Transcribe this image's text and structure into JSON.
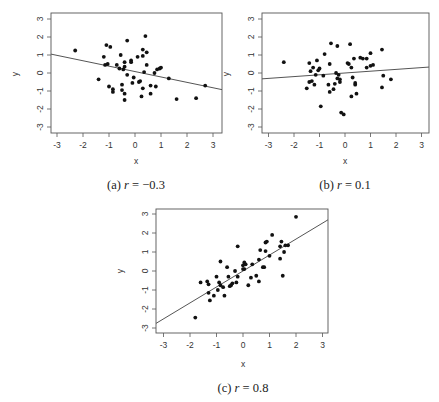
{
  "chart_data": [
    {
      "id": "a",
      "type": "scatter",
      "caption": "(a) r = −0.3",
      "caption_prefix": "(a) ",
      "caption_r": "r",
      "caption_eq": " = −0.3",
      "xlabel": "x",
      "ylabel": "y",
      "xlim": [
        -3.2,
        3.2
      ],
      "ylim": [
        -3.3,
        3.3
      ],
      "xticks": [
        -3,
        -2,
        -1,
        0,
        1,
        2,
        3
      ],
      "yticks": [
        -3,
        -2,
        -1,
        0,
        1,
        2,
        3
      ],
      "grid": false,
      "regression_line": {
        "slope": -0.3,
        "intercept": 0.08
      },
      "box": {
        "left": 51,
        "right": 222,
        "top": 13,
        "bottom": 133
      },
      "map": {
        "x0": 135,
        "sx": 26,
        "y0": 73,
        "sy": 18
      },
      "points": [
        [
          -2.3,
          1.25
        ],
        [
          -1.4,
          -0.35
        ],
        [
          -1.2,
          0.9
        ],
        [
          -1.15,
          0.45
        ],
        [
          -1.1,
          1.55
        ],
        [
          -1.05,
          0.5
        ],
        [
          -1.0,
          -0.75
        ],
        [
          -0.95,
          1.45
        ],
        [
          -0.85,
          -0.9
        ],
        [
          -0.85,
          -1.05
        ],
        [
          -0.7,
          0.45
        ],
        [
          -0.6,
          0.25
        ],
        [
          -0.55,
          1.0
        ],
        [
          -0.5,
          -0.95
        ],
        [
          -0.5,
          -0.65
        ],
        [
          -0.45,
          0.2
        ],
        [
          -0.4,
          0.6
        ],
        [
          -0.4,
          0.35
        ],
        [
          -0.4,
          -1.15
        ],
        [
          -0.4,
          -1.5
        ],
        [
          -0.3,
          1.8
        ],
        [
          -0.3,
          -0.1
        ],
        [
          -0.15,
          0.7
        ],
        [
          -0.15,
          0.6
        ],
        [
          -0.1,
          -0.55
        ],
        [
          -0.05,
          -0.25
        ],
        [
          0.1,
          0.9
        ],
        [
          0.15,
          -0.5
        ],
        [
          0.2,
          -0.45
        ],
        [
          0.25,
          -1.3
        ],
        [
          0.3,
          1.3
        ],
        [
          0.3,
          0.95
        ],
        [
          0.3,
          -0.85
        ],
        [
          0.35,
          0.05
        ],
        [
          0.4,
          2.05
        ],
        [
          0.45,
          1.15
        ],
        [
          0.45,
          0.45
        ],
        [
          0.6,
          -0.7
        ],
        [
          0.6,
          -1.15
        ],
        [
          0.75,
          0.0
        ],
        [
          0.8,
          -0.75
        ],
        [
          0.85,
          0.2
        ],
        [
          0.95,
          0.25
        ],
        [
          1.0,
          0.3
        ],
        [
          1.3,
          -0.3
        ],
        [
          1.6,
          -1.45
        ],
        [
          2.35,
          -1.4
        ],
        [
          2.7,
          -0.7
        ]
      ]
    },
    {
      "id": "b",
      "type": "scatter",
      "caption": "(b) r = 0.1",
      "caption_prefix": "(b) ",
      "caption_r": "r",
      "caption_eq": " = 0.1",
      "xlabel": "x",
      "ylabel": "y",
      "xlim": [
        -3.2,
        3.2
      ],
      "ylim": [
        -3.3,
        3.3
      ],
      "xticks": [
        -3,
        -2,
        -1,
        0,
        1,
        2,
        3
      ],
      "yticks": [
        -3,
        -2,
        -1,
        0,
        1,
        2,
        3
      ],
      "grid": false,
      "regression_line": {
        "slope": 0.1,
        "intercept": 0.0
      },
      "box": {
        "left": 262,
        "right": 429,
        "top": 13,
        "bottom": 133
      },
      "map": {
        "x0": 345,
        "sx": 25.5,
        "y0": 73,
        "sy": 18
      },
      "points": [
        [
          -2.4,
          0.6
        ],
        [
          -1.5,
          -0.85
        ],
        [
          -1.4,
          0.55
        ],
        [
          -1.4,
          -0.5
        ],
        [
          -1.35,
          0.1
        ],
        [
          -1.3,
          -0.45
        ],
        [
          -1.25,
          0.3
        ],
        [
          -1.2,
          -0.65
        ],
        [
          -1.15,
          -0.1
        ],
        [
          -1.1,
          0.7
        ],
        [
          -1.05,
          0.15
        ],
        [
          -1.0,
          0.25
        ],
        [
          -0.95,
          -1.85
        ],
        [
          -0.85,
          -0.15
        ],
        [
          -0.8,
          1.05
        ],
        [
          -0.65,
          -0.65
        ],
        [
          -0.6,
          -1.05
        ],
        [
          -0.6,
          0.5
        ],
        [
          -0.55,
          1.65
        ],
        [
          -0.45,
          -0.9
        ],
        [
          -0.4,
          -0.6
        ],
        [
          -0.35,
          0.0
        ],
        [
          -0.3,
          -0.3
        ],
        [
          -0.3,
          1.5
        ],
        [
          -0.25,
          -0.1
        ],
        [
          -0.2,
          -0.5
        ],
        [
          -0.2,
          -0.35
        ],
        [
          -0.15,
          -2.2
        ],
        [
          -0.05,
          -2.3
        ],
        [
          0.1,
          0.55
        ],
        [
          0.15,
          0.5
        ],
        [
          0.2,
          1.6
        ],
        [
          0.25,
          0.3
        ],
        [
          0.25,
          -1.3
        ],
        [
          0.3,
          -0.25
        ],
        [
          0.35,
          0.8
        ],
        [
          0.4,
          -0.55
        ],
        [
          0.4,
          -0.65
        ],
        [
          0.45,
          -1.15
        ],
        [
          0.6,
          0.85
        ],
        [
          0.7,
          0.8
        ],
        [
          0.85,
          0.8
        ],
        [
          0.85,
          0.3
        ],
        [
          1.0,
          1.1
        ],
        [
          1.0,
          0.4
        ],
        [
          1.1,
          0.45
        ],
        [
          1.45,
          1.3
        ],
        [
          1.45,
          -0.8
        ],
        [
          1.5,
          -0.15
        ],
        [
          1.8,
          -0.35
        ]
      ]
    },
    {
      "id": "c",
      "type": "scatter",
      "caption": "(c) r = 0.8",
      "caption_prefix": "(c) ",
      "caption_r": "r",
      "caption_eq": " = 0.8",
      "xlabel": "x",
      "ylabel": "y",
      "xlim": [
        -3.2,
        3.2
      ],
      "ylim": [
        -3.3,
        3.3
      ],
      "xticks": [
        -3,
        -2,
        -1,
        0,
        1,
        2,
        3
      ],
      "yticks": [
        -3,
        -2,
        -1,
        0,
        1,
        2,
        3
      ],
      "grid": false,
      "regression_line": {
        "slope": 0.84,
        "intercept": 0.0
      },
      "box": {
        "left": 156,
        "right": 328,
        "top": 209,
        "bottom": 333
      },
      "map": {
        "x0": 243,
        "sx": 26.5,
        "y0": 271,
        "sy": 19
      },
      "points": [
        [
          -1.8,
          -2.45
        ],
        [
          -1.6,
          -0.6
        ],
        [
          -1.35,
          -0.55
        ],
        [
          -1.3,
          -0.7
        ],
        [
          -1.3,
          -1.15
        ],
        [
          -1.25,
          -1.55
        ],
        [
          -1.1,
          -1.3
        ],
        [
          -1.0,
          -0.3
        ],
        [
          -0.95,
          -1.0
        ],
        [
          -0.9,
          -0.6
        ],
        [
          -0.85,
          0.5
        ],
        [
          -0.85,
          -0.75
        ],
        [
          -0.75,
          -0.85
        ],
        [
          -0.7,
          -1.3
        ],
        [
          -0.6,
          0.2
        ],
        [
          -0.55,
          -0.3
        ],
        [
          -0.5,
          -0.8
        ],
        [
          -0.45,
          -0.75
        ],
        [
          -0.4,
          -0.65
        ],
        [
          -0.3,
          0.0
        ],
        [
          -0.25,
          -0.6
        ],
        [
          -0.2,
          1.3
        ],
        [
          -0.2,
          -0.3
        ],
        [
          0.0,
          0.1
        ],
        [
          0.0,
          0.3
        ],
        [
          0.05,
          0.45
        ],
        [
          0.05,
          0.1
        ],
        [
          0.1,
          0.35
        ],
        [
          0.2,
          -0.75
        ],
        [
          0.3,
          -0.35
        ],
        [
          0.35,
          0.35
        ],
        [
          0.5,
          -0.25
        ],
        [
          0.6,
          -0.55
        ],
        [
          0.6,
          0.6
        ],
        [
          0.65,
          1.1
        ],
        [
          0.75,
          0.2
        ],
        [
          0.8,
          0.2
        ],
        [
          0.85,
          1.5
        ],
        [
          0.85,
          1.05
        ],
        [
          0.9,
          1.55
        ],
        [
          1.0,
          0.8
        ],
        [
          1.1,
          1.9
        ],
        [
          1.4,
          1.3
        ],
        [
          1.4,
          0.65
        ],
        [
          1.45,
          1.55
        ],
        [
          1.5,
          -0.25
        ],
        [
          1.55,
          1.0
        ],
        [
          1.6,
          1.35
        ],
        [
          1.7,
          1.35
        ],
        [
          2.0,
          2.85
        ]
      ]
    }
  ]
}
